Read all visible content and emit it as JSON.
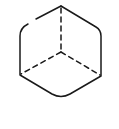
{
  "diagram": {
    "title": "",
    "stroke_color": "#1a1a1a",
    "background": "#ffffff",
    "visible_edges": "solid",
    "hidden_edges": "dashed",
    "vertices": {
      "top": [
        61,
        6
      ],
      "upper_left": [
        20,
        30
      ],
      "upper_right": [
        101,
        31
      ],
      "lower_left": [
        20,
        75
      ],
      "lower_right": [
        101,
        76
      ],
      "bottom": [
        61,
        97
      ],
      "center": [
        61,
        52
      ]
    }
  }
}
